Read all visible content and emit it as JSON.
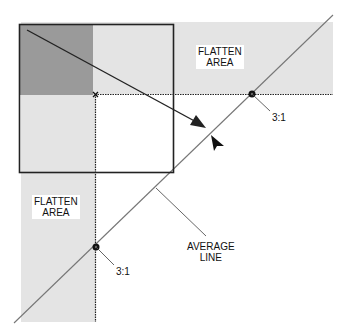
{
  "diagram": {
    "labels": {
      "flatten_top": "FLATTEN\nAREA",
      "flatten_left": "FLATTEN\nAREA",
      "ratio_top": "3:1",
      "ratio_left": "3:1",
      "average_line": "AVERAGE\nLINE"
    },
    "colors": {
      "flatten_fill": "#e4e4e4",
      "dark_fill": "#9a9a9a",
      "line": "#222222",
      "diagonal": "#777777",
      "background": "#ffffff"
    },
    "icons": [
      "arrow-icon",
      "cursor-arrow-icon",
      "x-marker-icon",
      "point-marker-icon"
    ]
  }
}
